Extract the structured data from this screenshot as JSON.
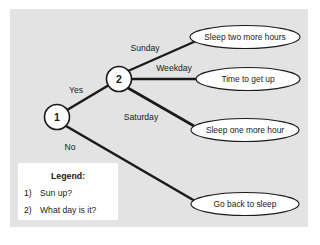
{
  "figure": {
    "name": "decision-tree-wake-up",
    "panel_bg": "#e2e2e2",
    "page_bg": "#ffffff",
    "stroke": "#1a1a1a",
    "node_fill": "#ffffff",
    "leaf_fill": "#ffffff",
    "legend_bg": "#ffffff"
  },
  "nodes": [
    {
      "id": "node-1",
      "label": "1",
      "cx": 57,
      "cy": 117,
      "r": 12.5
    },
    {
      "id": "node-2",
      "label": "2",
      "cx": 119,
      "cy": 79,
      "r": 12.5
    }
  ],
  "edges": [
    {
      "id": "edge-yes",
      "label": "Yes",
      "from": "node-1",
      "to": "node-2",
      "lx": 76,
      "ly": 93
    },
    {
      "id": "edge-no",
      "label": "No",
      "from": "node-1",
      "to": "leaf-4",
      "lx": 70,
      "ly": 150
    },
    {
      "id": "edge-sunday",
      "label": "Sunday",
      "from": "node-2",
      "to": "leaf-1",
      "lx": 145,
      "ly": 51
    },
    {
      "id": "edge-weekday",
      "label": "Weekday",
      "from": "node-2",
      "to": "leaf-2",
      "lx": 174,
      "ly": 71
    },
    {
      "id": "edge-saturday",
      "label": "Saturday",
      "from": "node-2",
      "to": "leaf-3",
      "lx": 141,
      "ly": 120
    }
  ],
  "leaves": [
    {
      "id": "leaf-1",
      "label": "Sleep two more hours",
      "cx": 245,
      "cy": 37,
      "rx": 55,
      "ry": 11.5
    },
    {
      "id": "leaf-2",
      "label": "Time to get up",
      "cx": 248,
      "cy": 79,
      "rx": 52,
      "ry": 11.5
    },
    {
      "id": "leaf-3",
      "label": "Sleep one more hour",
      "cx": 245,
      "cy": 130,
      "rx": 54,
      "ry": 11.5
    },
    {
      "id": "leaf-4",
      "label": "Go back to sleep",
      "cx": 245,
      "cy": 204,
      "rx": 54,
      "ry": 11.5
    }
  ],
  "legend": {
    "title": "Legend:",
    "items": [
      {
        "marker": "1)",
        "text": "Sun up?"
      },
      {
        "marker": "2)",
        "text": "What day is it?"
      }
    ]
  }
}
